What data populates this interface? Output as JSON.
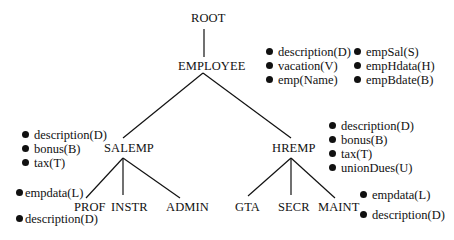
{
  "diagram": {
    "type": "class-hierarchy-tree",
    "nodes": {
      "root": "ROOT",
      "employee": "EMPLOYEE",
      "salemp": "SALEMP",
      "hremp": "HREMP",
      "prof": "PROF",
      "instr": "INSTR",
      "admin": "ADMIN",
      "gta": "GTA",
      "secr": "SECR",
      "maint": "MAINT"
    },
    "edges": [
      [
        "ROOT",
        "EMPLOYEE"
      ],
      [
        "EMPLOYEE",
        "SALEMP"
      ],
      [
        "EMPLOYEE",
        "HREMP"
      ],
      [
        "SALEMP",
        "PROF"
      ],
      [
        "SALEMP",
        "INSTR"
      ],
      [
        "SALEMP",
        "ADMIN"
      ],
      [
        "HREMP",
        "GTA"
      ],
      [
        "HREMP",
        "SECR"
      ],
      [
        "HREMP",
        "MAINT"
      ]
    ],
    "attributes": {
      "employee_col1": [
        "description(D)",
        "vacation(V)",
        "emp(Name)"
      ],
      "employee_col2": [
        "empSal(S)",
        "empHdata(H)",
        "empBdate(B)"
      ],
      "salemp": [
        "description(D)",
        "bonus(B)",
        "tax(T)"
      ],
      "hremp": [
        "description(D)",
        "bonus(B)",
        "tax(T)",
        "unionDues(U)"
      ],
      "prof": [
        "empdata(L)",
        "description(D)"
      ],
      "maint": [
        "empdata(L)",
        "description(D)"
      ]
    }
  }
}
